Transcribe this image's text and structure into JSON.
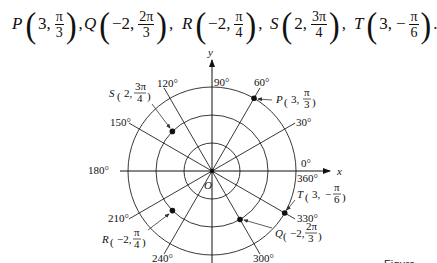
{
  "header": {
    "points": [
      {
        "name": "P",
        "r": "3,",
        "num": "π",
        "den": "3",
        "sign": "",
        "trail": ","
      },
      {
        "name": "Q",
        "r": "−2,",
        "num": "2π",
        "den": "3",
        "sign": "",
        "trail": ","
      },
      {
        "name": "R",
        "r": "−2,",
        "num": "π",
        "den": "4",
        "sign": "",
        "trail": ","
      },
      {
        "name": "S",
        "r": "2,",
        "num": "3π",
        "den": "4",
        "sign": "",
        "trail": ","
      },
      {
        "name": "T",
        "r": "3,",
        "num": "π",
        "den": "6",
        "sign": "−",
        "trail": "."
      }
    ]
  },
  "diagram": {
    "axes": {
      "x_label": "x",
      "y_label": "y",
      "origin_label": "O"
    },
    "angle_labels": {
      "a0": "0°",
      "a360": "360°",
      "a30": "30°",
      "a60": "60°",
      "a90": "90°",
      "a120": "120°",
      "a150": "150°",
      "a180": "180°",
      "a210": "210°",
      "a240": "240°",
      "a300": "300°",
      "a330": "330°"
    },
    "circle_radii": [
      1,
      2,
      3
    ],
    "plotted_points": [
      {
        "name": "P",
        "r": 3,
        "theta": "π/3",
        "label_r": "3,",
        "label_num": "π",
        "label_den": "3",
        "label_sign": ""
      },
      {
        "name": "S",
        "r": 2,
        "theta": "3π/4",
        "label_r": "2,",
        "label_num": "3π",
        "label_den": "4",
        "label_sign": ""
      },
      {
        "name": "T",
        "r": 3,
        "theta": "−π/6",
        "label_r": "3,",
        "label_num": "π",
        "label_den": "6",
        "label_sign": "−"
      },
      {
        "name": "Q",
        "r": -2,
        "theta": "2π/3",
        "label_r": "−2,",
        "label_num": "2π",
        "label_den": "3",
        "label_sign": ""
      },
      {
        "name": "R",
        "r": -2,
        "theta": "π/4",
        "label_r": "−2,",
        "label_num": "π",
        "label_den": "4",
        "label_sign": ""
      }
    ]
  },
  "caption": "Figure 8.4"
}
